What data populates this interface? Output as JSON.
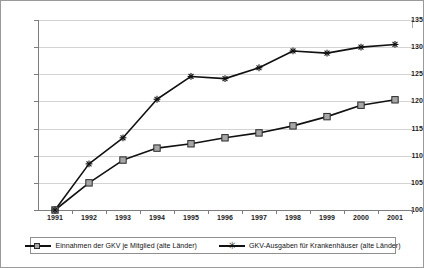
{
  "chart_data": {
    "type": "line",
    "title": "",
    "subtitle": "",
    "xlabel": "",
    "ylabel": "",
    "categories": [
      "1991",
      "1992",
      "1993",
      "1994",
      "1995",
      "1996",
      "1997",
      "1998",
      "1999",
      "2000",
      "2001"
    ],
    "ylim": [
      100,
      135
    ],
    "yticks": [
      100,
      105,
      110,
      115,
      120,
      125,
      130,
      135
    ],
    "grid": true,
    "legend_position": "bottom",
    "series": [
      {
        "name": "Einnahmen der GKV je Mitglied (alte Länder)",
        "marker": "square",
        "marker_color": "#a6a6a6",
        "line_color": "#111111",
        "values": [
          100.0,
          105.0,
          109.2,
          111.4,
          112.2,
          113.3,
          114.2,
          115.5,
          117.2,
          119.3,
          120.3
        ]
      },
      {
        "name": "GKV-Ausgaben für Krankenhäuser (alte Länder)",
        "marker": "star",
        "marker_color": "#111111",
        "line_color": "#111111",
        "values": [
          100.0,
          108.5,
          113.3,
          120.4,
          124.6,
          124.2,
          126.2,
          129.3,
          128.9,
          130.0,
          130.5
        ]
      }
    ]
  },
  "legend": {
    "entries": [
      {
        "label": "Einnahmen der GKV je Mitglied (alte Länder)",
        "marker": "square"
      },
      {
        "label": "GKV-Ausgaben für Krankenhäuser (alte Länder)",
        "marker": "star"
      }
    ]
  },
  "colors": {
    "grid": "#d4d4d4",
    "axis": "#7d7d7d",
    "line": "#111111",
    "square_marker_fill": "#a6a6a6",
    "border": "#9a9a9a",
    "text": "#111111"
  }
}
